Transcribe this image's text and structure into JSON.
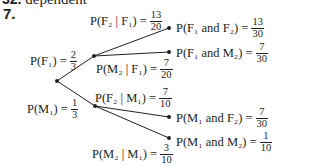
{
  "header": {
    "prev_item_number": "32.",
    "prev_item_text": "dependent",
    "question_number": "7."
  },
  "tree": {
    "first_stage": [
      {
        "label": "P(F₁) =",
        "num": "2",
        "den": "3"
      },
      {
        "label": "P(M₁) =",
        "num": "1",
        "den": "3"
      }
    ],
    "second_stage": [
      {
        "label": "P(F₂ | F₁) =",
        "num": "13",
        "den": "20"
      },
      {
        "label": "P(M₂ | F₁) =",
        "num": "7",
        "den": "20"
      },
      {
        "label": "P(F₂ | M₁) =",
        "num": "7",
        "den": "10"
      },
      {
        "label": "P(M₂ | M₁) =",
        "num": "3",
        "den": "10"
      }
    ],
    "outcomes": [
      {
        "label": "P(F₁ and F₂) =",
        "num": "13",
        "den": "30"
      },
      {
        "label": "P(F₁ and M₂) =",
        "num": "7",
        "den": "30"
      },
      {
        "label": "P(M₁ and F₂) =",
        "num": "7",
        "den": "30"
      },
      {
        "label": "P(M₁ and M₂) =",
        "num": "1",
        "den": "10"
      }
    ]
  }
}
